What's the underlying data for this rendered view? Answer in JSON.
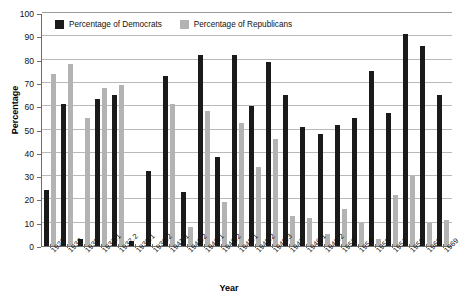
{
  "chart_data": {
    "type": "bar",
    "title": "",
    "xlabel": "Year",
    "ylabel": "Percentage",
    "ylim": [
      0,
      100
    ],
    "ytick_step": 10,
    "yticks": [
      0,
      10,
      20,
      30,
      40,
      50,
      60,
      70,
      80,
      90,
      100
    ],
    "grid": true,
    "legend_position": "top-left-inside",
    "categories": [
      "1923",
      "1933",
      "1935",
      "1937.1",
      "1937.2",
      "1939.1",
      "1939.2",
      "1941.1",
      "1941.2",
      "1943.1",
      "1943.2",
      "1945.1",
      "1945.2",
      "1945.3",
      "1947",
      "1949.1",
      "1949.2",
      "1953",
      "1954",
      "1955",
      "1957",
      "1959",
      "1963",
      "1969"
    ],
    "series": [
      {
        "name": "Percentage of Democrats",
        "color": "#1a1a1a",
        "values": [
          24,
          61,
          3,
          63,
          65,
          2,
          32,
          73,
          23,
          82,
          38,
          82,
          60,
          79,
          65,
          51,
          48,
          52,
          55,
          75,
          57,
          91,
          86,
          65
        ]
      },
      {
        "name": "Percentage of Republicans",
        "color": "#b3b3b3",
        "values": [
          74,
          78,
          55,
          68,
          69,
          0,
          0,
          61,
          8,
          58,
          19,
          53,
          34,
          46,
          13,
          12,
          5,
          16,
          10,
          3,
          22,
          30,
          10,
          11
        ]
      }
    ]
  },
  "legend": {
    "items": [
      {
        "label": "Percentage of Democrats"
      },
      {
        "label": "Percentage of Republicans"
      }
    ]
  },
  "axes": {
    "y_title": "Percentage",
    "x_title": "Year"
  }
}
